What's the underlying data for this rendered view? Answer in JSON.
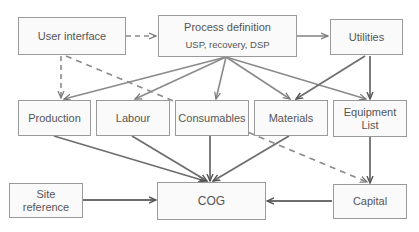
{
  "nodes": {
    "user_interface": {
      "label": "User interface"
    },
    "process_definition": {
      "label": "Process definition",
      "sublabel": "USP, recovery, DSP"
    },
    "utilities": {
      "label": "Utilities"
    },
    "production": {
      "label": "Production"
    },
    "labour": {
      "label": "Labour"
    },
    "consumables": {
      "label": "Consumables"
    },
    "materials": {
      "label": "Materials"
    },
    "equipment_list": {
      "label": "Equipment List"
    },
    "site_reference": {
      "label": "Site reference"
    },
    "cog": {
      "label": "COG"
    },
    "capital": {
      "label": "Capital"
    }
  },
  "edges": [
    {
      "from": "User interface",
      "to": "Process definition",
      "style": "dashed"
    },
    {
      "from": "User interface",
      "to": "Production",
      "style": "dashed"
    },
    {
      "from": "User interface",
      "to": "Capital",
      "style": "dashed"
    },
    {
      "from": "Process definition",
      "to": "Utilities",
      "style": "solid"
    },
    {
      "from": "Process definition",
      "to": "Production",
      "style": "solid"
    },
    {
      "from": "Process definition",
      "to": "Labour",
      "style": "solid"
    },
    {
      "from": "Process definition",
      "to": "Consumables",
      "style": "solid"
    },
    {
      "from": "Process definition",
      "to": "Materials",
      "style": "solid"
    },
    {
      "from": "Process definition",
      "to": "Equipment List",
      "style": "solid"
    },
    {
      "from": "Utilities",
      "to": "Materials",
      "style": "solid"
    },
    {
      "from": "Utilities",
      "to": "Equipment List",
      "style": "solid"
    },
    {
      "from": "Production",
      "to": "COG",
      "style": "solid"
    },
    {
      "from": "Labour",
      "to": "COG",
      "style": "solid"
    },
    {
      "from": "Consumables",
      "to": "COG",
      "style": "solid"
    },
    {
      "from": "Materials",
      "to": "COG",
      "style": "solid"
    },
    {
      "from": "Equipment List",
      "to": "Capital",
      "style": "solid"
    },
    {
      "from": "Site reference",
      "to": "COG",
      "style": "solid"
    },
    {
      "from": "Capital",
      "to": "COG",
      "style": "solid"
    }
  ],
  "colors": {
    "line": "#8a8a8a",
    "line_dark": "#6e6e6e",
    "box_border": "#9a9a9a",
    "text": "#555555"
  }
}
